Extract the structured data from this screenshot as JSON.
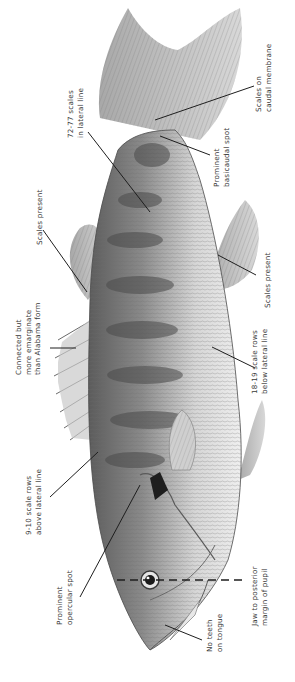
{
  "figure": {
    "orientation": "rotated 90° counter-clockwise; head at bottom, tail at top",
    "colors": {
      "ink": "#3a3a3a",
      "body_light": "#d9d9d9",
      "body_dark": "#5a5a5a",
      "background": "#ffffff"
    }
  },
  "annotations": [
    {
      "id": "caudal-membrane",
      "lines": [
        "Scales on",
        "caudal membrane"
      ]
    },
    {
      "id": "basicaudal-spot",
      "lines": [
        "Prominent",
        "basicaudal spot"
      ]
    },
    {
      "id": "lateral-line-scales",
      "lines": [
        "72-77 scales",
        "in lateral line"
      ]
    },
    {
      "id": "dorsal-scales",
      "lines": [
        "Scales present"
      ]
    },
    {
      "id": "anal-scales",
      "lines": [
        "Scales present"
      ]
    },
    {
      "id": "dorsal-connection",
      "lines": [
        "Connected but",
        "more emarginate",
        "than Alabama form"
      ]
    },
    {
      "id": "below-lateral",
      "lines": [
        "18-19 scale rows",
        "below lateral line"
      ]
    },
    {
      "id": "above-lateral",
      "lines": [
        "9-10 scale rows",
        "above lateral line"
      ]
    },
    {
      "id": "opercular-spot",
      "lines": [
        "Prominent",
        "opercular spot"
      ]
    },
    {
      "id": "jaw-pupil",
      "lines": [
        "Jaw to posterior",
        "margin of pupil"
      ]
    },
    {
      "id": "tongue-teeth",
      "lines": [
        "No teeth",
        "on tongue"
      ]
    }
  ]
}
